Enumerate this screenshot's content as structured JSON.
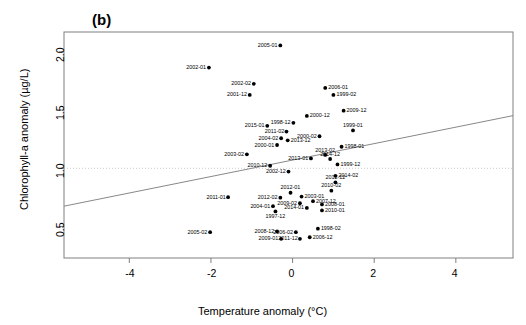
{
  "figure": {
    "panel_label": "(b)",
    "background": "#ffffff",
    "point_color": "#000000",
    "line_color": "#7a7a7a",
    "frame_color": "#808080"
  },
  "chart_data": {
    "type": "scatter",
    "title": "(b)",
    "xlabel": "Temperature anomaly (°C)",
    "ylabel": "Chlorophyll-a anomaly (µg/L)",
    "xlim": [
      -5.6,
      5.4
    ],
    "ylim": [
      0.23,
      2.17
    ],
    "xticks": [
      -4,
      -2,
      0,
      2,
      4
    ],
    "yticks": [
      0.5,
      1.0,
      1.5,
      2.0
    ],
    "xticklabels": [
      "-4",
      "-2",
      "0",
      "2",
      "4"
    ],
    "yticklabels": [
      "0.5",
      "1.0",
      "1.5",
      "2.0"
    ],
    "grid": false,
    "legend": null,
    "reference_line": {
      "type": "horizontal",
      "y": 1.0,
      "style": "dotted",
      "color": "#bfbfbf"
    },
    "trend_line": {
      "type": "linear",
      "x0": -5.6,
      "y0": 0.675,
      "x1": 5.4,
      "y1": 1.452,
      "color": "#7a7a7a"
    },
    "point_label_position": "varies",
    "points": [
      {
        "label": "2005-01",
        "x": -0.3,
        "y": 2.055,
        "lp": "left"
      },
      {
        "label": "2002-01",
        "x": -2.05,
        "y": 1.865,
        "lp": "left"
      },
      {
        "label": "2002-02",
        "x": -0.95,
        "y": 1.725,
        "lp": "left"
      },
      {
        "label": "2001-12",
        "x": -1.05,
        "y": 1.63,
        "lp": "left"
      },
      {
        "label": "2006-01",
        "x": 0.8,
        "y": 1.69,
        "lp": "right"
      },
      {
        "label": "1999-02",
        "x": 1.0,
        "y": 1.63,
        "lp": "right"
      },
      {
        "label": "2009-12",
        "x": 1.25,
        "y": 1.495,
        "lp": "right"
      },
      {
        "label": "2000-12",
        "x": 0.35,
        "y": 1.45,
        "lp": "right"
      },
      {
        "label": "1998-12",
        "x": 0.02,
        "y": 1.39,
        "lp": "left"
      },
      {
        "label": "2015-01",
        "x": -0.62,
        "y": 1.365,
        "lp": "left"
      },
      {
        "label": "1999-01",
        "x": 1.48,
        "y": 1.325,
        "lp": "above"
      },
      {
        "label": "2011-02",
        "x": -0.15,
        "y": 1.315,
        "lp": "left"
      },
      {
        "label": "2000-02",
        "x": 0.66,
        "y": 1.275,
        "lp": "left"
      },
      {
        "label": "2004-02",
        "x": -0.28,
        "y": 1.258,
        "lp": "left"
      },
      {
        "label": "2013-12",
        "x": -0.12,
        "y": 1.24,
        "lp": "right"
      },
      {
        "label": "2000-01",
        "x": -0.38,
        "y": 1.2,
        "lp": "left"
      },
      {
        "label": "1998-01",
        "x": 1.2,
        "y": 1.185,
        "lp": "right"
      },
      {
        "label": "2003-02",
        "x": -1.12,
        "y": 1.12,
        "lp": "left"
      },
      {
        "label": "2013-02",
        "x": 0.8,
        "y": 1.115,
        "lp": "above"
      },
      {
        "label": "2013-01",
        "x": 0.45,
        "y": 1.085,
        "lp": "left"
      },
      {
        "label": "2014-12",
        "x": 0.92,
        "y": 1.08,
        "lp": "above"
      },
      {
        "label": "1999-12",
        "x": 1.1,
        "y": 1.033,
        "lp": "right"
      },
      {
        "label": "2010-12",
        "x": -0.55,
        "y": 1.022,
        "lp": "left"
      },
      {
        "label": "2002-12",
        "x": -0.1,
        "y": 0.972,
        "lp": "left"
      },
      {
        "label": "2014-02",
        "x": 1.05,
        "y": 0.935,
        "lp": "right"
      },
      {
        "label": "2012-12",
        "x": 1.05,
        "y": 0.88,
        "lp": "above"
      },
      {
        "label": "2012-01",
        "x": -0.05,
        "y": 0.79,
        "lp": "above"
      },
      {
        "label": "2010-02",
        "x": 0.95,
        "y": 0.808,
        "lp": "above"
      },
      {
        "label": "2011-01",
        "x": -1.58,
        "y": 0.752,
        "lp": "left"
      },
      {
        "label": "2012-02",
        "x": -0.3,
        "y": 0.748,
        "lp": "left"
      },
      {
        "label": "2003-01",
        "x": 0.22,
        "y": 0.757,
        "lp": "right"
      },
      {
        "label": "2007-12",
        "x": 0.5,
        "y": 0.718,
        "lp": "right"
      },
      {
        "label": "2009-02",
        "x": 0.18,
        "y": 0.7,
        "lp": "left"
      },
      {
        "label": "2008-01",
        "x": 0.72,
        "y": 0.69,
        "lp": "right"
      },
      {
        "label": "2004-01",
        "x": -0.48,
        "y": 0.675,
        "lp": "left"
      },
      {
        "label": "2014-01",
        "x": 0.35,
        "y": 0.66,
        "lp": "left"
      },
      {
        "label": "2010-01",
        "x": 0.72,
        "y": 0.638,
        "lp": "right"
      },
      {
        "label": "1997-12",
        "x": -0.42,
        "y": 0.63,
        "lp": "below"
      },
      {
        "label": "1998-02",
        "x": 0.62,
        "y": 0.482,
        "lp": "right"
      },
      {
        "label": "2005-02",
        "x": -2.02,
        "y": 0.452,
        "lp": "left"
      },
      {
        "label": "2008-12",
        "x": -0.38,
        "y": 0.458,
        "lp": "left"
      },
      {
        "label": "2006-02",
        "x": 0.08,
        "y": 0.452,
        "lp": "left"
      },
      {
        "label": "2009-01",
        "x": -0.28,
        "y": 0.395,
        "lp": "left"
      },
      {
        "label": "2011-12",
        "x": 0.18,
        "y": 0.395,
        "lp": "left"
      },
      {
        "label": "2006-12",
        "x": 0.42,
        "y": 0.408,
        "lp": "right"
      }
    ]
  }
}
